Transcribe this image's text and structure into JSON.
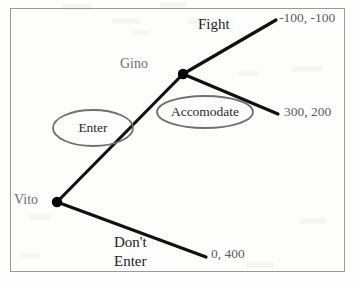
{
  "diagram": {
    "type": "extensive-form-game-tree",
    "colors": {
      "branch": "#111111",
      "node": "#000000",
      "player_label": "#6e6e6e",
      "payoff_label": "#5d5d5d",
      "action_label": "#1d1d1d",
      "ellipse_stroke": "#707070",
      "frame": "#9a9a9a",
      "background": "#fdfdfc"
    },
    "nodes": [
      {
        "id": "vito",
        "label": "Vito",
        "x": 57,
        "y": 202,
        "label_x": 14,
        "label_y": 194
      },
      {
        "id": "gino",
        "label": "Gino",
        "x": 183,
        "y": 74,
        "label_x": 120,
        "label_y": 58
      }
    ],
    "branches": [
      {
        "id": "enter",
        "from": "vito",
        "to": "gino",
        "x1": 57,
        "y1": 202,
        "x2": 183,
        "y2": 74
      },
      {
        "id": "dont-enter",
        "from": "vito",
        "to": "payoff-0-400",
        "x1": 57,
        "y1": 202,
        "x2": 206,
        "y2": 257
      },
      {
        "id": "fight",
        "from": "gino",
        "to": "payoff-100-100",
        "x1": 183,
        "y1": 74,
        "x2": 276,
        "y2": 20
      },
      {
        "id": "accomodate",
        "from": "gino",
        "to": "payoff-300-200",
        "x1": 183,
        "y1": 74,
        "x2": 278,
        "y2": 114
      }
    ],
    "action_labels": [
      {
        "id": "fight",
        "text": "Fight",
        "x": 198,
        "y": 18,
        "style": "plain"
      },
      {
        "id": "dont-enter-line1",
        "text": "Don't",
        "x": 114,
        "y": 234,
        "style": "plain"
      },
      {
        "id": "dont-enter-line2",
        "text": "Enter",
        "x": 114,
        "y": 253,
        "style": "plain"
      }
    ],
    "circled_labels": [
      {
        "id": "enter",
        "text": "Enter",
        "cx": 93,
        "cy": 128,
        "rx": 40,
        "ry": 18
      },
      {
        "id": "accomodate",
        "text": "Accomodate",
        "cx": 205,
        "cy": 112,
        "rx": 48,
        "ry": 16
      }
    ],
    "payoffs": [
      {
        "id": "payoff-100-100",
        "text": "-100, -100",
        "x": 279,
        "y": 12
      },
      {
        "id": "payoff-300-200",
        "text": "300, 200",
        "x": 284,
        "y": 106
      },
      {
        "id": "payoff-0-400",
        "text": "0, 400",
        "x": 211,
        "y": 248
      }
    ]
  }
}
